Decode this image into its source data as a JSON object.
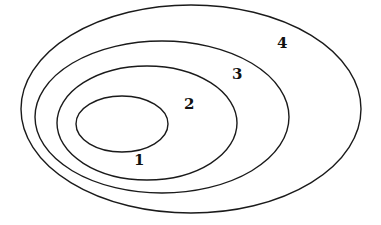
{
  "diagram": {
    "type": "nested-ellipses",
    "background": "#ffffff",
    "stroke_color": "#1a1a1a",
    "ellipses": [
      {
        "id": "1",
        "cx": 122,
        "cy": 124,
        "rx": 46,
        "ry": 28
      },
      {
        "id": "2",
        "cx": 147,
        "cy": 123,
        "rx": 90,
        "ry": 57
      },
      {
        "id": "3",
        "cx": 162,
        "cy": 117,
        "rx": 127,
        "ry": 76
      },
      {
        "id": "4",
        "cx": 191,
        "cy": 109,
        "rx": 170,
        "ry": 104
      }
    ],
    "labels": [
      {
        "text": "1",
        "x": 134,
        "y": 165
      },
      {
        "text": "2",
        "x": 184,
        "y": 109
      },
      {
        "text": "3",
        "x": 232,
        "y": 79
      },
      {
        "text": "4",
        "x": 277,
        "y": 48
      }
    ]
  }
}
